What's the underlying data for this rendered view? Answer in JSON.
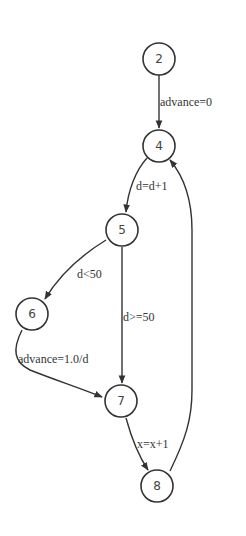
{
  "diagram": {
    "type": "control-flow-graph",
    "nodes": [
      {
        "id": "2",
        "label": "2",
        "cx": 159,
        "cy": 59
      },
      {
        "id": "4",
        "label": "4",
        "cx": 159,
        "cy": 146
      },
      {
        "id": "5",
        "label": "5",
        "cx": 122,
        "cy": 230
      },
      {
        "id": "6",
        "label": "6",
        "cx": 32,
        "cy": 314
      },
      {
        "id": "7",
        "label": "7",
        "cx": 121,
        "cy": 401
      },
      {
        "id": "8",
        "label": "8",
        "cx": 157,
        "cy": 486
      }
    ],
    "edges": [
      {
        "from": "2",
        "to": "4",
        "label": "advance=0"
      },
      {
        "from": "4",
        "to": "5",
        "label": "d=d+1"
      },
      {
        "from": "5",
        "to": "6",
        "label": "d<50"
      },
      {
        "from": "5",
        "to": "7",
        "label": "d>=50"
      },
      {
        "from": "6",
        "to": "7",
        "label": "advance=1.0/d"
      },
      {
        "from": "7",
        "to": "8",
        "label": "x=x+1"
      },
      {
        "from": "8",
        "to": "4",
        "label": ""
      }
    ],
    "colors": {
      "stroke": "#333333",
      "background": "#ffffff"
    }
  }
}
